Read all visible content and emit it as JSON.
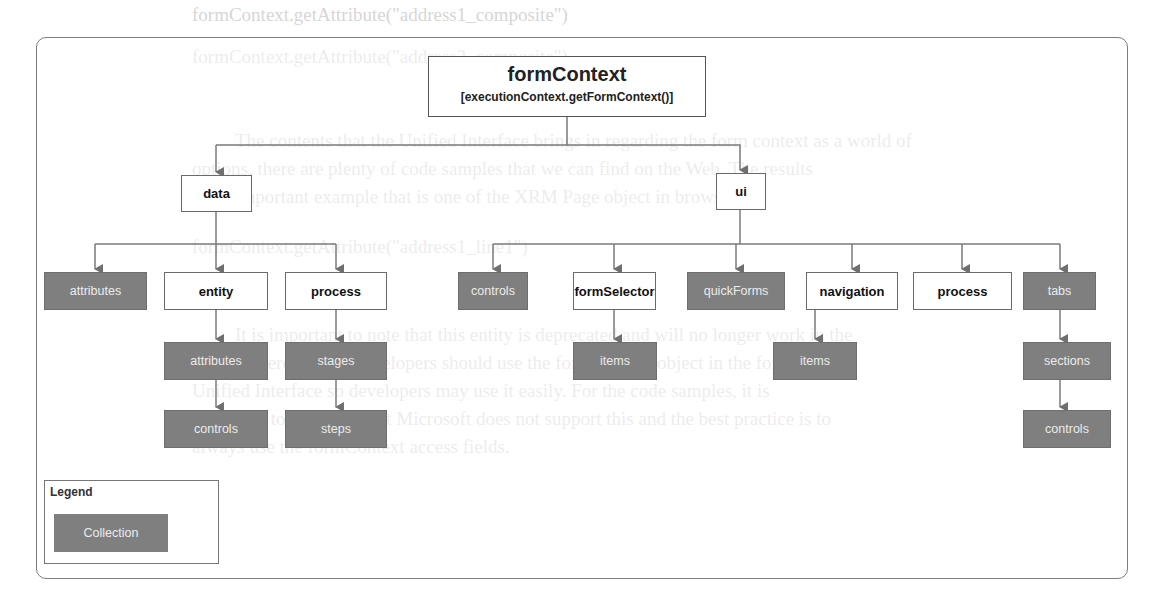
{
  "background_text": {
    "lines": [
      "formContext.getAttribute(\"address1_composite\")",
      "formContext.getAttribute(\"address2_composite\")",
      "The contents that the Unified Interface brings in regarding the form context as a world of",
      "options, there are plenty of code samples that we can find on the Web. The results",
      "of an important example that is one of the XRM Page object in browser",
      "formContext.getAttribute(\"address1_line1\")",
      "It is important to note that this entity is deprecated and will no longer work in the",
      "future. Therefore, all developers should use the formContext object in the form for the",
      "Unified Interface so developers may use it easily. For the code samples, it is",
      "important to point out that Microsoft does not support this and the best practice is to",
      "always use the formContext access fields."
    ]
  },
  "diagram": {
    "root": {
      "title": "formContext",
      "subtitle": "[executionContext.getFormContext()]"
    },
    "level1": {
      "data": "data",
      "ui": "ui"
    },
    "data_children": {
      "attributes": "attributes",
      "entity": "entity",
      "process": "process"
    },
    "entity_children": {
      "attributes": "attributes",
      "controls": "controls"
    },
    "process_children": {
      "stages": "stages",
      "steps": "steps"
    },
    "ui_children": {
      "controls": "controls",
      "formSelector": "formSelector",
      "quickForms": "quickForms",
      "navigation": "navigation",
      "process": "process",
      "tabs": "tabs"
    },
    "formSelector_children": {
      "items": "items"
    },
    "navigation_children": {
      "items": "items"
    },
    "tabs_children": {
      "sections": "sections",
      "controls": "controls"
    },
    "legend": {
      "title": "Legend",
      "collection_label": "Collection"
    },
    "colors": {
      "collection_fill": "#7f7f7f",
      "collection_text": "#ececec",
      "object_fill": "#ffffff",
      "connector": "#7a7a7a",
      "frame_border": "#7d7d7d"
    }
  }
}
